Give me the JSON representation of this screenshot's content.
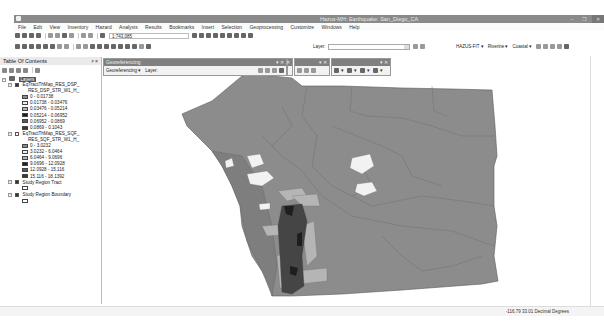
{
  "app": {
    "title": "Hazus-MH: Earthquake: San_Diego_CA",
    "window_controls": [
      "minimize",
      "restore",
      "close"
    ]
  },
  "menu": [
    "File",
    "Edit",
    "View",
    "Inventory",
    "Hazard",
    "Analysis",
    "Results",
    "Bookmarks",
    "Insert",
    "Selection",
    "Geoprocessing",
    "Customize",
    "Windows",
    "Help"
  ],
  "toolbar": {
    "scale": "1:743,085",
    "layer_label": "Layer:",
    "layer_value": "",
    "hazus_fit": "HAZUS-FIT ▾",
    "riverine": "Riverine ▾",
    "coastal": "Coastal ▾"
  },
  "toc": {
    "title": "Table Of Contents",
    "pin": "ᵖ ×",
    "dataframe": "Layers",
    "layers": [
      {
        "name": "EqTractThMap_RES_DSP_",
        "field": "RES_DSP_STR_W1_H_",
        "checked": true,
        "classes": [
          {
            "label": "0 - 0.01738",
            "color": "#8c8c8c"
          },
          {
            "label": "0.01738 - 0.03476",
            "color": "#efefef"
          },
          {
            "label": "0.03476 - 0.05214",
            "color": "#b5b5b5"
          },
          {
            "label": "0.05214 - 0.06952",
            "color": "#1e1e1e"
          },
          {
            "label": "0.06952 - 0.0869",
            "color": "#5a5a5a"
          },
          {
            "label": "0.0869 - 0.1043",
            "color": "#3a3a3a"
          }
        ]
      },
      {
        "name": "EqTractThMap_RES_SQF_",
        "field": "RES_SQF_STR_W1_H_",
        "checked": false,
        "classes": [
          {
            "label": "0 - 3.0232",
            "color": "#8c8c8c"
          },
          {
            "label": "3.0232 - 6.0464",
            "color": "#efefef"
          },
          {
            "label": "6.0464 - 9.0696",
            "color": "#b5b5b5"
          },
          {
            "label": "9.0696 - 12.0928",
            "color": "#1e1e1e"
          },
          {
            "label": "12.0928 - 15.116",
            "color": "#5a5a5a"
          },
          {
            "label": "15.116 - 18.1392",
            "color": "#3a3a3a"
          }
        ]
      },
      {
        "name": "Study Region Tract",
        "checked": true
      },
      {
        "name": "Study Region Boundary",
        "checked": true
      }
    ]
  },
  "georeferencing": {
    "title": "Georeferencing",
    "menu_label": "Georeferencing ▾",
    "layer_label": "Layer:"
  },
  "status": {
    "coords": "-116.79  33.01 Decimal Degrees"
  },
  "map": {
    "base_color": "#8c8c8c",
    "boundary_color": "#5a5a5a",
    "background": "#ffffff"
  }
}
